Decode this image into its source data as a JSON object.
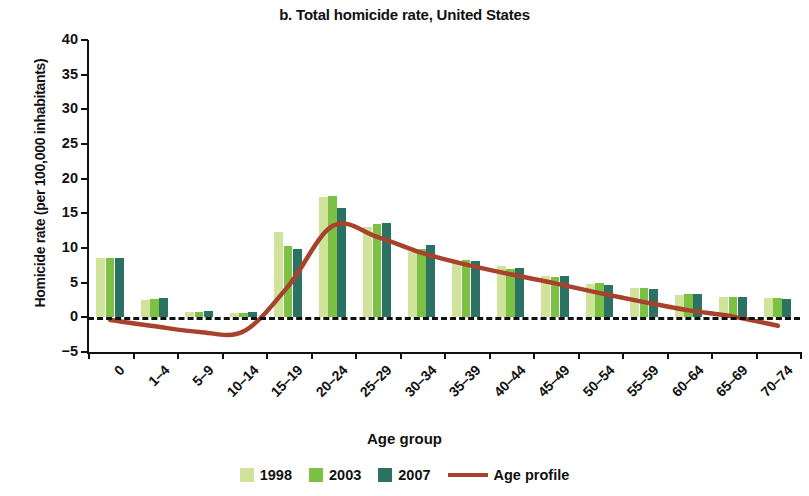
{
  "chart_data": {
    "type": "bar",
    "title": "b. Total homicide rate, United States",
    "xlabel": "Age group",
    "ylabel": "Homicide rate (per 100,000 inhabitants)",
    "ylim": [
      -5,
      40
    ],
    "yticks": [
      -5,
      0,
      5,
      10,
      15,
      20,
      25,
      30,
      35,
      40
    ],
    "grid": false,
    "legend_position": "bottom",
    "categories": [
      "0",
      "1–4",
      "5–9",
      "10–14",
      "15–19",
      "20–24",
      "25–29",
      "30–34",
      "35–39",
      "40–44",
      "45–49",
      "50–54",
      "55–59",
      "60–64",
      "65–69",
      "70–74"
    ],
    "series": [
      {
        "name": "1998",
        "color": "#cfe49a",
        "values": [
          8.5,
          2.5,
          0.8,
          0.7,
          12.3,
          17.3,
          13.0,
          9.4,
          8.2,
          7.4,
          5.9,
          4.8,
          4.2,
          3.2,
          2.9,
          2.8
        ]
      },
      {
        "name": "2003",
        "color": "#7cc144",
        "values": [
          8.6,
          2.6,
          0.8,
          0.7,
          10.3,
          17.5,
          13.5,
          9.8,
          8.3,
          7.0,
          5.8,
          4.9,
          4.3,
          3.4,
          3.0,
          2.8
        ]
      },
      {
        "name": "2007",
        "color": "#2b7263",
        "values": [
          8.5,
          2.8,
          0.9,
          0.8,
          9.9,
          15.8,
          13.6,
          10.5,
          8.2,
          7.1,
          5.9,
          4.7,
          4.1,
          3.3,
          2.9,
          2.6
        ]
      }
    ],
    "overlay": {
      "name": "Age profile",
      "type": "line",
      "color": "#a8422c",
      "values": [
        -0.4,
        -1.3,
        -2.1,
        -2.0,
        4.5,
        13.2,
        11.6,
        9.3,
        7.6,
        6.2,
        4.9,
        3.5,
        2.2,
        1.0,
        0.1,
        -1.2
      ]
    }
  },
  "legend": {
    "items": [
      {
        "label": "1998"
      },
      {
        "label": "2003"
      },
      {
        "label": "2007"
      },
      {
        "label": "Age profile"
      }
    ]
  }
}
